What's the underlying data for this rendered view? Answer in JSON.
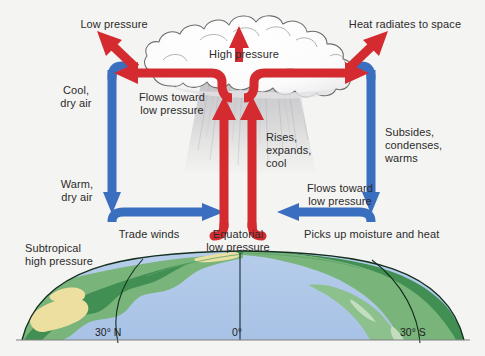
{
  "figure": {
    "background_color": "#f4f4f2"
  },
  "colors": {
    "red_arrow": "#d42b30",
    "blue_arrow": "#3a6ebf",
    "ocean": "#adc6e8",
    "land_green": "#76b277",
    "land_dark_green": "#3f8d51",
    "desert_yellow": "#ecdf9a",
    "cloud_white": "#fdfdfd",
    "cloud_outline": "#6c6c6c",
    "rain_shading": "#b9b9bd",
    "text": "#2b2b2b",
    "globe_outline": "#14301f"
  },
  "labels": {
    "low_pressure": "Low pressure",
    "high_pressure": "High pressure",
    "heat_radiates": "Heat radiates to space",
    "cool_dry_air": "Cool,\ndry air",
    "flows_toward_low_pressure_left": "Flows toward\nlow pressure",
    "rises_expands_cool": "Rises,\nexpands,\ncool",
    "subsides_condenses_warms": "Subsides,\ncondenses,\nwarms",
    "warm_dry_air": "Warm,\ndry air",
    "flows_toward_low_pressure_right": "Flows toward\nlow pressure",
    "trade_winds": "Trade winds",
    "equatorial_low_pressure": "Equatorial\nlow pressure",
    "picks_up_moisture": "Picks up moisture and heat",
    "subtropical_high_pressure": "Subtropical\nhigh pressure"
  },
  "latitude_ticks": [
    {
      "label": "30° N",
      "x": 118
    },
    {
      "label": "0°",
      "x": 240
    },
    {
      "label": "30° S",
      "x": 420
    }
  ],
  "flow_arrows": [
    {
      "name": "updraft-left",
      "type": "red",
      "direction": "up",
      "meaning": "rising air at equator"
    },
    {
      "name": "updraft-right",
      "type": "red",
      "direction": "up",
      "meaning": "rising air at equator"
    },
    {
      "name": "cloud-top-vent",
      "type": "red",
      "direction": "up",
      "meaning": "High pressure aloft"
    },
    {
      "name": "outflow-left",
      "type": "red",
      "direction": "left",
      "meaning": "Flows toward low pressure"
    },
    {
      "name": "outflow-right",
      "type": "red",
      "direction": "right",
      "meaning": "Flows toward low pressure"
    },
    {
      "name": "radiate-left",
      "type": "red",
      "direction": "up-left",
      "meaning": "Low pressure"
    },
    {
      "name": "radiate-right",
      "type": "red",
      "direction": "up-right",
      "meaning": "Heat radiates to space"
    },
    {
      "name": "subsidence-left",
      "type": "blue",
      "direction": "down",
      "meaning": "Cool, dry air descending"
    },
    {
      "name": "subsidence-right",
      "type": "blue",
      "direction": "down",
      "meaning": "Subsides, condenses, warms"
    },
    {
      "name": "trade-wind-left",
      "type": "blue",
      "direction": "right",
      "meaning": "Trade winds"
    },
    {
      "name": "trade-wind-right",
      "type": "blue",
      "direction": "left",
      "meaning": "Picks up moisture and heat"
    }
  ]
}
